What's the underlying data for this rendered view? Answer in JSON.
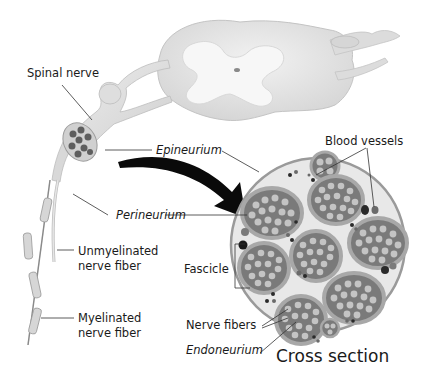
{
  "diagram": {
    "labels": {
      "spinal_nerve": "Spinal nerve",
      "epineurium": "Epineurium",
      "blood_vessels": "Blood vessels",
      "perineurium": "Perineurium",
      "unmyelinated_1": "Unmyelinated",
      "unmyelinated_2": "nerve fiber",
      "fascicle": "Fascicle",
      "myelinated_1": "Myelinated",
      "myelinated_2": "nerve fiber",
      "nerve_fibers": "Nerve fibers",
      "endoneurium": "Endoneurium",
      "cross_section": "Cross section"
    },
    "colors": {
      "tissue_light": "#e6e6e6",
      "tissue_mid": "#cfcfcf",
      "tissue_outline": "#9a9a9a",
      "fascicle_fill": "#7a7a7a",
      "fascicle_ring": "#a8a8a8",
      "fiber_fill": "#c4c4c4",
      "vessel_dark": "#2a2a2a",
      "arrow": "#0a0a0a",
      "leader_line": "#333333"
    }
  }
}
